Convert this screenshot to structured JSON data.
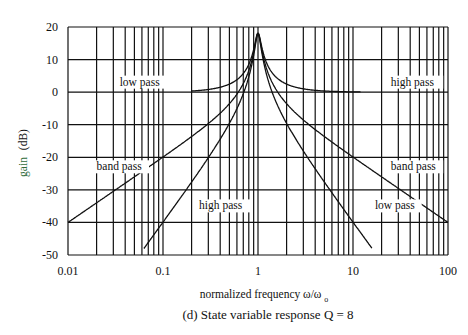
{
  "chart_data": {
    "type": "line",
    "title": "(d)  State variable response  Q = 8",
    "xlabel": "normalized frequency  ω/ω",
    "xlabel_subscript": "o",
    "ylabel_main": "gain",
    "ylabel_unit": "(dB)",
    "x_scale": "log",
    "xlim": [
      0.01,
      100
    ],
    "ylim": [
      -50,
      20
    ],
    "x_ticks": [
      0.01,
      0.1,
      1,
      10,
      100
    ],
    "x_tick_labels": [
      "0.01",
      "0.1",
      "1",
      "10",
      "100"
    ],
    "y_ticks": [
      20,
      10,
      0,
      -10,
      -20,
      -30,
      -40,
      -50
    ],
    "y_tick_labels": [
      "20",
      "10",
      "0",
      "-10",
      "-20",
      "-30",
      "-40",
      "-50"
    ],
    "grid": true,
    "Q": 8,
    "series": [
      {
        "name": "low pass",
        "formula": "1/sqrt((1-w^2)^2+(w/Q)^2)",
        "x_range": [
          0.2,
          15.8
        ],
        "x": [
          0.2,
          0.5,
          0.8,
          0.9,
          1.0,
          1.1,
          1.2,
          2,
          5,
          10,
          15.8
        ],
        "values": [
          0.4,
          2.5,
          8.6,
          12.6,
          18.1,
          11.5,
          6.6,
          -9.5,
          -27.6,
          -39.9,
          -47.9
        ]
      },
      {
        "name": "band pass",
        "formula": "w/sqrt((1-w^2)^2+(w/Q)^2)",
        "x_range": [
          0.01,
          100
        ],
        "x": [
          0.01,
          0.1,
          0.5,
          0.9,
          1.0,
          1.1,
          2,
          10,
          100
        ],
        "values": [
          -40,
          -19.9,
          -3.5,
          11.7,
          18.1,
          12.3,
          -3.5,
          -19.9,
          -40
        ]
      },
      {
        "name": "high pass",
        "formula": "w^2/sqrt((1-w^2)^2+(w/Q)^2)",
        "x_range": [
          0.063,
          12
        ],
        "x": [
          0.063,
          0.1,
          0.5,
          0.9,
          1.0,
          1.1,
          2,
          5,
          12
        ],
        "values": [
          -48,
          -39.9,
          -9.5,
          10.8,
          18.1,
          13.1,
          2.5,
          0.4,
          0.0
        ]
      }
    ],
    "annotations": [
      {
        "text": "low pass",
        "x": 0.035,
        "y": 2
      },
      {
        "text": "high pass",
        "x": 25,
        "y": 2
      },
      {
        "text": "band pass",
        "x": 0.02,
        "y": -24
      },
      {
        "text": "band pass",
        "x": 25,
        "y": -24
      },
      {
        "text": "high pass",
        "x": 0.24,
        "y": -36
      },
      {
        "text": "low pass",
        "x": 17,
        "y": -36
      }
    ]
  }
}
